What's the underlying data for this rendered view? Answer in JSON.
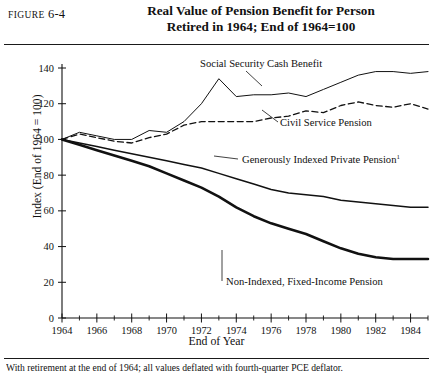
{
  "figure": {
    "label_prefix": "Figure",
    "label_number": "6-4",
    "title_line1": "Real Value of Pension Benefit for Person",
    "title_line2": "Retired in 1964; End of 1964=100",
    "footnote": "With retirement at the end of 1964; all values deflated with fourth-quarter PCE deflator."
  },
  "chart_data": {
    "type": "line",
    "title": "Real Value of Pension Benefit for Person Retired in 1964; End of 1964=100",
    "xlabel": "End of Year",
    "ylabel": "Index (End of 1964 = 100)",
    "xlim": [
      1964,
      1985
    ],
    "ylim": [
      0,
      140
    ],
    "yticks": [
      0,
      20,
      40,
      60,
      80,
      100,
      120,
      140
    ],
    "xticks": [
      1964,
      1966,
      1968,
      1970,
      1972,
      1974,
      1976,
      1978,
      1980,
      1982,
      1984
    ],
    "xticks_minor": [
      1965,
      1967,
      1969,
      1971,
      1973,
      1975,
      1977,
      1979,
      1981,
      1983,
      1985
    ],
    "grid": false,
    "legend": "inline-annotations",
    "x": [
      1964,
      1965,
      1966,
      1967,
      1968,
      1969,
      1970,
      1971,
      1972,
      1973,
      1974,
      1975,
      1976,
      1977,
      1978,
      1979,
      1980,
      1981,
      1982,
      1983,
      1984,
      1985
    ],
    "series": [
      {
        "name": "Social Security Cash Benefit",
        "style": "solid-thin",
        "color": "#111111",
        "label_x": 1972.0,
        "label_y": 133,
        "values": [
          100,
          104,
          102,
          100,
          100,
          105,
          104,
          110,
          120,
          134,
          124,
          125,
          125,
          126,
          124,
          128,
          132,
          136,
          138,
          138,
          137,
          138
        ]
      },
      {
        "name": "Civil Service Pension",
        "style": "dashed",
        "color": "#111111",
        "label_x": 1975.2,
        "label_y": 113,
        "values": [
          100,
          103,
          101,
          99,
          98,
          101,
          103,
          108,
          110,
          110,
          110,
          110,
          112,
          113,
          116,
          115,
          119,
          121,
          119,
          118,
          120,
          117
        ]
      },
      {
        "name": "Generously Indexed Private Pension",
        "style": "solid-medium",
        "color": "#111111",
        "superscript": "1",
        "label_x": 1973.0,
        "label_y": 84,
        "values": [
          100,
          98,
          96,
          94,
          92,
          90,
          88,
          86,
          84,
          81,
          78,
          75,
          72,
          70,
          69,
          68,
          66,
          65,
          64,
          63,
          62,
          62
        ]
      },
      {
        "name": "Non-Indexed, Fixed-Income Pension",
        "style": "solid-bold",
        "color": "#111111",
        "label_x": 1975.6,
        "label_y": 26,
        "values": [
          100,
          97,
          94,
          91,
          88,
          85,
          81,
          77,
          73,
          68,
          62,
          57,
          53,
          50,
          47,
          43,
          39,
          36,
          34,
          33,
          33,
          33
        ]
      }
    ]
  }
}
